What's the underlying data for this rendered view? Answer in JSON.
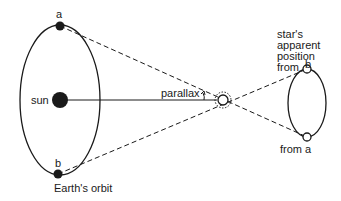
{
  "diagram": {
    "labels": {
      "earth_point_a": "a",
      "earth_point_b": "b",
      "sun": "sun",
      "earth_orbit": "Earth's orbit",
      "parallax": "parallax",
      "apparent_position_line1": "star's",
      "apparent_position_line2": "apparent",
      "apparent_position_line3": "position",
      "apparent_position_line4": "from",
      "apparent_b": "b",
      "from_a": "from a"
    },
    "colors": {
      "ink": "#1a1a1a",
      "background": "#ffffff"
    }
  }
}
